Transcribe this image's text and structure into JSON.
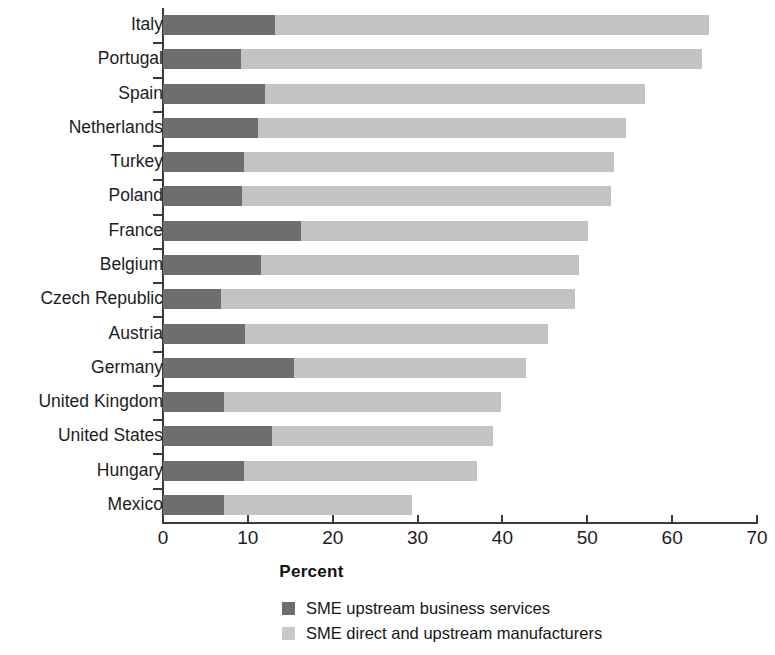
{
  "chart_data": {
    "type": "bar",
    "orientation": "horizontal",
    "stacked": true,
    "title": "",
    "xlabel": "Percent",
    "ylabel": "",
    "xlim": [
      0,
      70
    ],
    "xticks": [
      0,
      10,
      20,
      30,
      40,
      50,
      60,
      70
    ],
    "grid": false,
    "legend_position": "bottom",
    "categories": [
      "Italy",
      "Portugal",
      "Spain",
      "Netherlands",
      "Turkey",
      "Poland",
      "France",
      "Belgium",
      "Czech Republic",
      "Austria",
      "Germany",
      "United Kingdom",
      "United States",
      "Hungary",
      "Mexico"
    ],
    "series": [
      {
        "name": "SME upstream business services",
        "color": "#6e6e6e",
        "values": [
          13.2,
          9.2,
          12.0,
          11.2,
          9.5,
          9.3,
          16.3,
          11.5,
          6.8,
          9.7,
          15.4,
          7.2,
          12.8,
          9.5,
          7.2
        ]
      },
      {
        "name": "SME direct and upstream manufacturers",
        "color": "#c3c3c3",
        "values": [
          51.1,
          54.3,
          44.8,
          43.4,
          43.7,
          43.5,
          33.8,
          37.5,
          41.8,
          35.7,
          27.4,
          32.6,
          26.1,
          27.5,
          22.1
        ]
      }
    ],
    "totals": [
      64.3,
      63.5,
      56.8,
      54.6,
      53.2,
      52.8,
      50.1,
      49.0,
      48.6,
      45.4,
      42.8,
      39.8,
      38.9,
      37.0,
      29.3
    ]
  },
  "legend": {
    "items": [
      {
        "label": "SME upstream business services",
        "color": "#6e6e6e"
      },
      {
        "label": "SME direct and upstream manufacturers",
        "color": "#c9c9c9"
      }
    ]
  }
}
